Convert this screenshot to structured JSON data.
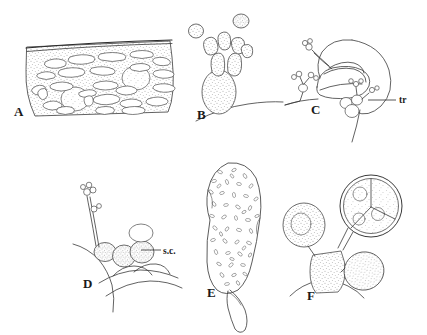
{
  "figure": {
    "background_color": "#ffffff",
    "ink_color": "#3a3a3a",
    "style": "line drawing with stipple shading",
    "panel_count": 6
  },
  "panels": [
    {
      "id": "A",
      "label": "A",
      "label_x": 14,
      "label_y": 116,
      "subject": "stippled tissue cross-section with elongated cells beneath a cuticle line",
      "annotations": []
    },
    {
      "id": "B",
      "label": "B",
      "label_x": 197,
      "label_y": 119,
      "subject": "branched stippled conidiophore on host surface with two detached spores above",
      "annotations": []
    },
    {
      "id": "C",
      "label": "C",
      "label_x": 311,
      "label_y": 114,
      "subject": "hyphae with lobed haustoria and small branched clusters inside host cell",
      "annotations": [
        {
          "text": "tr",
          "x": 399,
          "y": 103,
          "leader_from_x": 396,
          "leader_from_y": 100,
          "leader_to_x": 368,
          "leader_to_y": 100
        }
      ]
    },
    {
      "id": "D",
      "label": "D",
      "label_x": 83,
      "label_y": 288,
      "subject": "chain of stippled spore cells with erect branched conidiophore on host surface",
      "annotations": [
        {
          "text": "s.c.",
          "x": 163,
          "y": 254,
          "leader_from_x": 161,
          "leader_from_y": 250,
          "leader_to_x": 141,
          "leader_to_y": 250
        }
      ]
    },
    {
      "id": "E",
      "label": "E",
      "label_x": 207,
      "label_y": 297,
      "subject": "large flask-shaped sporangium filled with numerous small rod-shaped inclusions",
      "annotations": []
    },
    {
      "id": "F",
      "label": "F",
      "label_x": 307,
      "label_y": 300,
      "subject": "large septate sporangium with internal divisions plus two smaller stippled bodies on a stalk",
      "annotations": []
    }
  ]
}
